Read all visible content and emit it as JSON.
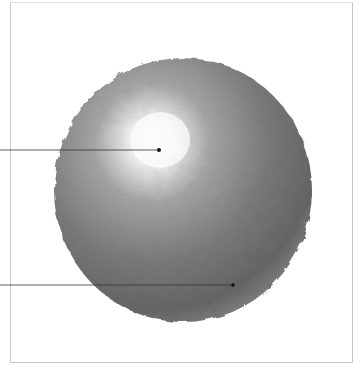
{
  "figure": {
    "colors": {
      "background": "#ffffff",
      "frame": "#c8c8c8",
      "highlight": "#ffffff",
      "shadow": "#5a5a5a",
      "leader_line": "#333333"
    },
    "sphere": {
      "cx": 183,
      "cy": 190,
      "rx": 129,
      "ry": 132
    },
    "highlight": {
      "cx": 160,
      "cy": 140
    },
    "callouts": [
      {
        "id": "highlight-callout",
        "line_from_x": 0,
        "y": 150,
        "dot_x": 159
      },
      {
        "id": "shadow-callout",
        "line_from_x": 0,
        "y": 285,
        "dot_x": 233
      }
    ]
  }
}
